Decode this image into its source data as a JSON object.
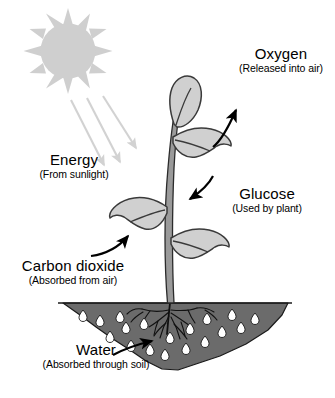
{
  "diagram": {
    "background_color": "#ffffff",
    "labels": {
      "oxygen": {
        "title": "Oxygen",
        "sub": "(Released into air)"
      },
      "energy": {
        "title": "Energy",
        "sub": "(From sunlight)"
      },
      "glucose": {
        "title": "Glucose",
        "sub": "(Used by plant)"
      },
      "carbon_dioxide": {
        "title": "Carbon dioxide",
        "sub": "(Absorbed from air)"
      },
      "water": {
        "title": "Water",
        "sub": "(Absorbed through soil)"
      }
    },
    "colors": {
      "sun": "#cfcfcf",
      "sunbeam": "#d2d2d2",
      "leaf_fill": "#d0d0d0",
      "leaf_outline": "#3a3a3a",
      "stem_fill": "#9a9a9a",
      "stem_outline": "#2b2b2b",
      "soil_fill": "#6b6b6b",
      "soil_outline": "#1a1a1a",
      "droplet_fill": "#ffffff",
      "root": "#111111",
      "arrow": "#000000",
      "text": "#000000"
    },
    "icons": {
      "sun": "sun-icon",
      "sunbeam": "sunbeam-arrow-icon",
      "oxygen_arrow": "curved-arrow-icon",
      "glucose_arrow": "curved-arrow-icon",
      "co2_arrow": "curved-arrow-icon",
      "water_arrow": "curved-arrow-icon",
      "plant": "plant-icon",
      "soil": "soil-mound-icon",
      "droplet": "water-droplet-icon",
      "roots": "roots-icon"
    }
  }
}
